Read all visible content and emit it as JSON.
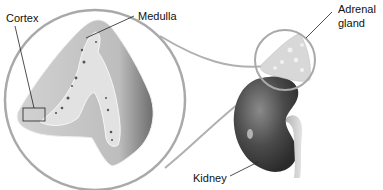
{
  "diagram": {
    "labels": {
      "cortex": "Cortex",
      "medulla": "Medulla",
      "adrenal_line1": "Adrenal",
      "adrenal_line2": "gland",
      "kidney": "Kidney"
    },
    "colors": {
      "outline": "#a9a9a9",
      "cortex_fill": "#c9c9c9",
      "medulla_fill": "#e2e2e2",
      "kidney_dark": "#3c3c3c",
      "kidney_mid": "#6a6a6a",
      "adrenal_fill": "#d6d6d6",
      "leader_line": "#222222"
    }
  }
}
